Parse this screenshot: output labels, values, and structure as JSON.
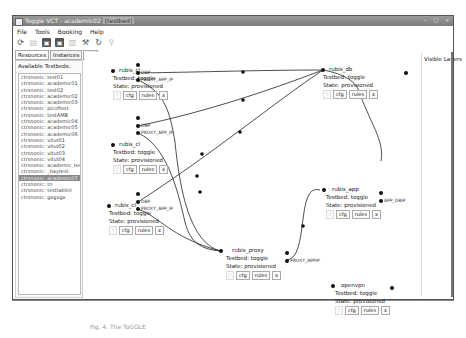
{
  "window": {
    "title": "Toggle VCT - academic02",
    "title_tag": "[testbed]",
    "controls": [
      "minimize",
      "maximize",
      "close"
    ]
  },
  "menu": [
    "File",
    "Tools",
    "Booking",
    "Help"
  ],
  "toolbar": [
    {
      "icon": "refresh-circle-icon"
    },
    {
      "icon": "save-disabled-icon"
    },
    {
      "icon": "save-icon"
    },
    {
      "icon": "save-as-icon"
    },
    {
      "icon": "trash-icon"
    },
    {
      "icon": "tool-icon"
    },
    {
      "icon": "reload-icon"
    },
    {
      "icon": "search-icon"
    }
  ],
  "tabs": [
    {
      "label": "Resources",
      "active": true
    },
    {
      "label": "Instances",
      "active": false
    },
    {
      "label": "+ -",
      "active": false
    }
  ],
  "left_panel": {
    "header": "Available Testbeds:",
    "items": [
      "ctrsnonic: test01",
      "ctrsnonic: academic01",
      "ctrsnonic: test02",
      "ctrsnonic: academic02",
      "ctrsnonic: academic03",
      "ctrsnonic: picoffest",
      "ctrsnonic: testAMB",
      "ctrsnonic: academic04",
      "ctrsnonic: academic05",
      "ctrsnonic: academic06",
      "ctrsnonic: vitut01",
      "ctrsnonic: vitut02",
      "ctrsnonic: vitut03",
      "ctrsnonic: vitut04",
      "ctrsnonic: academic_test_tc",
      "ctrsnonic: _baytest",
      "ctrsnonic: academic07",
      "ctrsnonic: tn",
      "ctrsnonic: testlablinl",
      "ctrsnonic: gxgxgx"
    ],
    "selected_index": 16
  },
  "right_panel": {
    "title": "Visible Layers"
  },
  "nodes": [
    {
      "name": "rubis_cl",
      "type": "Testbed: toggle",
      "state": "State: provisioned",
      "buttons": [
        "!",
        "cfg",
        "rules",
        "x"
      ],
      "ports": [
        "DBP",
        "PROXY_APP_IP"
      ]
    },
    {
      "name": "rubis_cl",
      "type": "Testbed: toggle",
      "state": "State: provisioned",
      "buttons": [
        "!",
        "cfg",
        "rules",
        "x"
      ],
      "ports": [
        "DBP",
        "PROXY_APP_IP"
      ]
    },
    {
      "name": "rubis_cl",
      "type": "Testbed: toggle",
      "state": "State: provisioned",
      "buttons": [
        "!",
        "cfg",
        "rules",
        "x"
      ],
      "ports": [
        "DBP",
        "PROXY_APP_IP"
      ]
    },
    {
      "name": "rubis_db",
      "type": "Testbed: toggle",
      "state": "State: provisioned",
      "buttons": [
        "!",
        "cfg",
        "rules",
        "x"
      ],
      "ports": []
    },
    {
      "name": "rubis_app",
      "type": "Testbed: toggle",
      "state": "State: provisioned",
      "buttons": [
        "!",
        "cfg",
        "rules",
        "x"
      ],
      "ports": [
        "APP_DBIP"
      ]
    },
    {
      "name": "rubis_proxy",
      "type": "Testbed: toggle",
      "state": "State: provisioned",
      "buttons": [
        "!",
        "cfg",
        "rules",
        "x"
      ],
      "ports": [
        "PROXY_APPIP"
      ]
    },
    {
      "name": "openvpn",
      "type": "Testbed: toggle",
      "state": "State: provisioned",
      "buttons": [
        "!",
        "cfg",
        "rules",
        "x"
      ],
      "ports": []
    }
  ],
  "caption": "Fig. 4. The ToGGLE"
}
